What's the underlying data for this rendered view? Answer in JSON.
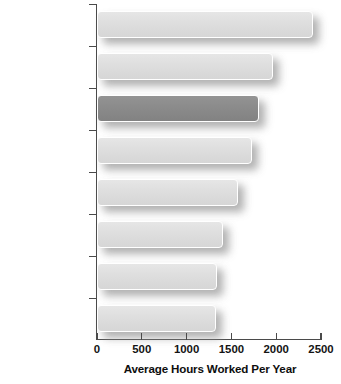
{
  "chart_data": {
    "type": "bar",
    "orientation": "horizontal",
    "title": "",
    "xlabel": "Average Hours Worked Per Year",
    "ylabel": "",
    "xlim": [
      0,
      2500
    ],
    "xticks": [
      0,
      500,
      1000,
      1500,
      2000,
      2500
    ],
    "xtick_labels": [
      "0",
      "500",
      "1000",
      "1500",
      "2000",
      "2500"
    ],
    "grid": false,
    "legend": null,
    "categories": [
      "South Korea",
      "Poland",
      "United States",
      "Japan",
      "United Kingdom",
      "France",
      "Norway",
      "Netherlands"
    ],
    "values": [
      2410,
      1960,
      1810,
      1730,
      1570,
      1410,
      1340,
      1330
    ],
    "series": [
      {
        "name": "Average Hours Worked Per Year",
        "values": [
          2410,
          1960,
          1810,
          1730,
          1570,
          1410,
          1340,
          1330
        ]
      }
    ],
    "highlighted_category": "United States",
    "bars": [
      {
        "label": "South Korea",
        "value": 2410
      },
      {
        "label": "Poland",
        "value": 1960
      },
      {
        "label": "United States",
        "value": 1810
      },
      {
        "label": "Japan",
        "value": 1730
      },
      {
        "label": "United Kingdom",
        "value": 1570
      },
      {
        "label": "France",
        "value": 1410
      },
      {
        "label": "Norway",
        "value": 1340
      },
      {
        "label": "Netherlands",
        "value": 1330
      }
    ],
    "colors": {
      "bar_fill": "#dedede",
      "bar_highlight_fill": "#8b8b8b",
      "bar_outline": "#ffffff",
      "axis": "#4a4a4a",
      "text": "#141414",
      "background": "#ffffff"
    }
  }
}
